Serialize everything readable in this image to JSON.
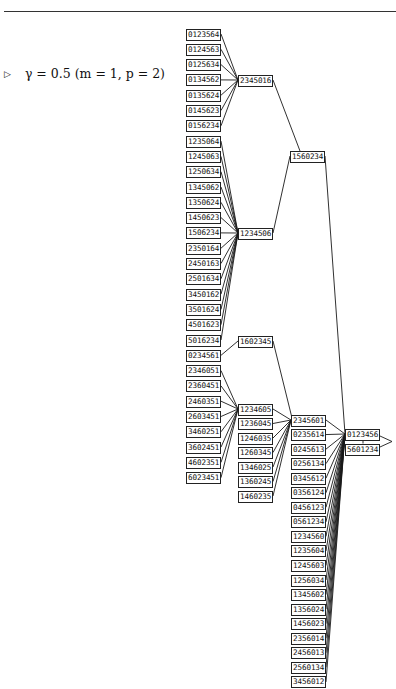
{
  "caption": {
    "marker": "▷",
    "gamma": "γ = 0.5",
    "params": "(m = 1, p = 2)"
  },
  "tree": {
    "root_pair": [
      "0123456",
      "5601234"
    ],
    "columns": {
      "col0": [
        "0123564",
        "0124563",
        "0125634",
        "0134562",
        "0135624",
        "0145623",
        "0156234",
        "1235064",
        "1245063",
        "1250634",
        "1345062",
        "1350624",
        "1450623",
        "1506234",
        "2350164",
        "2450163",
        "2501634",
        "3450162",
        "3501624",
        "4501623",
        "5016234",
        "0234561",
        "2346051",
        "2360451",
        "2460351",
        "2603451",
        "3460251",
        "3602451",
        "4602351",
        "6023451"
      ],
      "col1": [
        "2345016",
        "1234506",
        "1602345",
        "1234605",
        "1236045",
        "1246035",
        "1260345",
        "1346025",
        "1360245",
        "1460235"
      ],
      "col2": [
        "1560234"
      ],
      "col3": [
        "2345601",
        "0235614",
        "0245613",
        "0256134",
        "0345612",
        "0356124",
        "0456123",
        "0561234",
        "1234560",
        "1235604",
        "1245603",
        "1256034",
        "1345602",
        "1356024",
        "1456023",
        "2356014",
        "2456013",
        "2560134",
        "3456012"
      ]
    },
    "edges": [
      [
        "0123564",
        "2345016"
      ],
      [
        "0124563",
        "2345016"
      ],
      [
        "0125634",
        "2345016"
      ],
      [
        "0134562",
        "2345016"
      ],
      [
        "0135624",
        "2345016"
      ],
      [
        "0145623",
        "2345016"
      ],
      [
        "0156234",
        "2345016"
      ],
      [
        "1235064",
        "1234506"
      ],
      [
        "1245063",
        "1234506"
      ],
      [
        "1250634",
        "1234506"
      ],
      [
        "1345062",
        "1234506"
      ],
      [
        "1350624",
        "1234506"
      ],
      [
        "1450623",
        "1234506"
      ],
      [
        "1506234",
        "1234506"
      ],
      [
        "2350164",
        "1234506"
      ],
      [
        "2450163",
        "1234506"
      ],
      [
        "2501634",
        "1234506"
      ],
      [
        "3450162",
        "1234506"
      ],
      [
        "3501624",
        "1234506"
      ],
      [
        "4501623",
        "1234506"
      ],
      [
        "5016234",
        "1234506"
      ],
      [
        "2345016",
        "1560234"
      ],
      [
        "1234506",
        "1560234"
      ],
      [
        "1560234",
        "0123456"
      ],
      [
        "0234561",
        "1602345"
      ],
      [
        "1602345",
        "2345601"
      ],
      [
        "2346051",
        "1234605"
      ],
      [
        "2360451",
        "1234605"
      ],
      [
        "2460351",
        "1234605"
      ],
      [
        "2603451",
        "1234605"
      ],
      [
        "3460251",
        "1234605"
      ],
      [
        "3602451",
        "1234605"
      ],
      [
        "4602351",
        "1234605"
      ],
      [
        "6023451",
        "1234605"
      ],
      [
        "1234605",
        "2345601"
      ],
      [
        "1236045",
        "2345601"
      ],
      [
        "1246035",
        "2345601"
      ],
      [
        "1260345",
        "2345601"
      ],
      [
        "1346025",
        "2345601"
      ],
      [
        "1360245",
        "2345601"
      ],
      [
        "1460235",
        "2345601"
      ],
      [
        "2345601",
        "0123456"
      ],
      [
        "0235614",
        "0123456"
      ],
      [
        "0245613",
        "0123456"
      ],
      [
        "0256134",
        "0123456"
      ],
      [
        "0345612",
        "0123456"
      ],
      [
        "0356124",
        "0123456"
      ],
      [
        "0456123",
        "0123456"
      ],
      [
        "0561234",
        "0123456"
      ],
      [
        "1234560",
        "0123456"
      ],
      [
        "1235604",
        "0123456"
      ],
      [
        "1245603",
        "0123456"
      ],
      [
        "1256034",
        "0123456"
      ],
      [
        "1345602",
        "0123456"
      ],
      [
        "1356024",
        "0123456"
      ],
      [
        "1456023",
        "0123456"
      ],
      [
        "2356014",
        "0123456"
      ],
      [
        "2456013",
        "0123456"
      ],
      [
        "2560134",
        "0123456"
      ],
      [
        "3456012",
        "0123456"
      ]
    ]
  }
}
